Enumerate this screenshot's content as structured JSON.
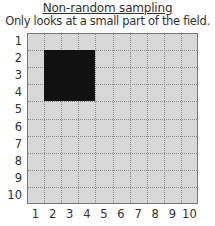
{
  "title": "Non-random sampling",
  "subtitle": "Only looks at a small part of the field.",
  "grid": {
    "rows": 10,
    "cols": 10,
    "background": "#d8d8d8",
    "sample_color": "#111111",
    "sampled_region": {
      "col_start": 2,
      "col_end": 4,
      "row_start": 2,
      "row_end": 4
    }
  },
  "y_labels": [
    "1",
    "2",
    "3",
    "4",
    "5",
    "6",
    "7",
    "8",
    "9",
    "10"
  ],
  "x_labels": [
    "1",
    "2",
    "3",
    "4",
    "5",
    "6",
    "7",
    "8",
    "9",
    "10"
  ]
}
